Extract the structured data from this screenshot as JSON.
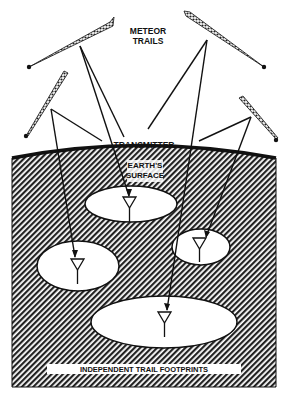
{
  "diagram": {
    "labels": {
      "meteor_trails_line1": "METEOR",
      "meteor_trails_line2": "TRAILS",
      "transmitter": "TRANSMITTER",
      "earth_line1": "EARTH'S",
      "earth_line2": "SURFACE",
      "footprints": "INDEPENDENT TRAIL FOOTPRINTS"
    },
    "meteor_trails": [
      {
        "name": "trail-top-left"
      },
      {
        "name": "trail-top-right"
      },
      {
        "name": "trail-mid-left"
      },
      {
        "name": "trail-mid-right"
      }
    ],
    "footprints": [
      {
        "name": "footprint-top-center"
      },
      {
        "name": "footprint-left"
      },
      {
        "name": "footprint-right-small"
      },
      {
        "name": "footprint-bottom-large"
      }
    ],
    "colors": {
      "ink": "#111111",
      "background": "#ffffff"
    }
  }
}
